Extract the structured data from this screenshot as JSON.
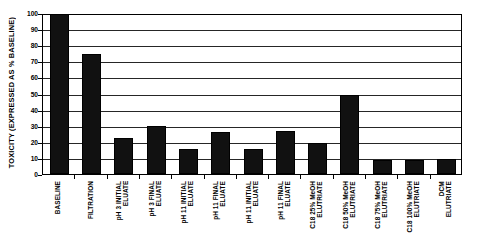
{
  "chart_data": {
    "type": "bar",
    "title": "",
    "subtitle": "",
    "xlabel": "",
    "ylabel": "TOXICITY (EXPRESSED AS % BASELINE)",
    "ylim": [
      0,
      100
    ],
    "y_ticks": [
      0,
      10,
      20,
      30,
      40,
      50,
      60,
      70,
      80,
      90,
      100
    ],
    "y_tick_labels": [
      "0",
      "10",
      "20",
      "30",
      "40",
      "50",
      "60",
      "70",
      "80",
      "90",
      "100"
    ],
    "grid": true,
    "grid_axis": "y",
    "legend": false,
    "legend_position": "none",
    "bar_color": "#111111",
    "categories": [
      "BASELINE",
      "FILTRATION",
      "pH 3 INITIAL ELUATE",
      "pH 3 FINAL ELUATE",
      "pH 11 INITIAL ELUATE",
      "pH 11 FINAL ELUATE",
      "pH 11 INITIAL ELUATE",
      "pH 11 FINAL ELUATE",
      "C18 25% MeOH ELUTRIATE",
      "C18 50% MeOH ELUTRIATE",
      "C18 75% MeOH ELUTRIATE",
      "C18 100% MeOH ELUTRIATE",
      "DCM ELUTRIATE"
    ],
    "category_label_lines": [
      [
        "BASELINE"
      ],
      [
        "FILTRATION"
      ],
      [
        "pH 3 INITIAL",
        "ELUATE"
      ],
      [
        "pH 3 FINAL",
        "ELUATE"
      ],
      [
        "pH 11 INITIAL",
        "ELUATE"
      ],
      [
        "pH 11 FINAL",
        "ELUATE"
      ],
      [
        "pH 11 INITIAL",
        "ELUATE"
      ],
      [
        "pH 11 FINAL",
        "ELUATE"
      ],
      [
        "C18 25% MeOH",
        "ELUTRIATE"
      ],
      [
        "C18 50% MeOH",
        "ELUTRIATE"
      ],
      [
        "C18 75% MeOH",
        "ELUTRIATE"
      ],
      [
        "C18 100% MeOH",
        "ELUTRIATE"
      ],
      [
        "DCM",
        "ELUTRIATE"
      ]
    ],
    "values": [
      100,
      74.5,
      22.5,
      30,
      15.5,
      26,
      15.5,
      27,
      19.5,
      49,
      8.5,
      8.5,
      9.5
    ]
  }
}
